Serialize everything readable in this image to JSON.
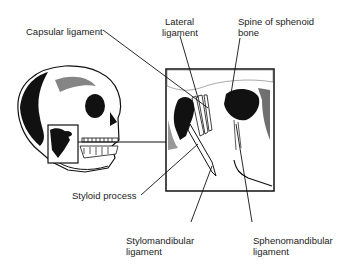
{
  "figure": {
    "labels": {
      "capsular": "Capsular ligament",
      "lateral_line1": "Lateral",
      "lateral_line2": "ligament",
      "spine_line1": "Spine of sphenoid",
      "spine_line2": "bone",
      "styloid": "Styloid process",
      "stylo_line1": "Stylomandibular",
      "stylo_line2": "ligament",
      "spheno_line1": "Sphenomandibular",
      "spheno_line2": "ligament"
    },
    "colors": {
      "ink": "#111111",
      "paper": "#ffffff"
    }
  }
}
